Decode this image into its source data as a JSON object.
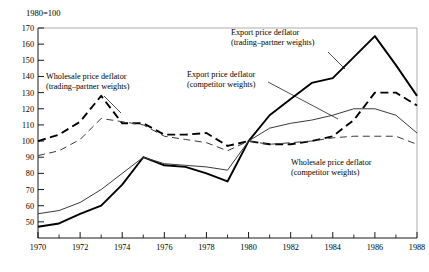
{
  "chart_data": {
    "type": "line",
    "title": "",
    "unit_note": "1980=100",
    "xlabel": "",
    "ylabel": "",
    "x": [
      1970,
      1971,
      1972,
      1973,
      1974,
      1975,
      1976,
      1977,
      1978,
      1979,
      1980,
      1981,
      1982,
      1983,
      1984,
      1985,
      1986,
      1987,
      1988
    ],
    "xlim": [
      1970,
      1988
    ],
    "ylim": [
      40,
      170
    ],
    "ytick_labels": [
      "50",
      "60",
      "70",
      "80",
      "90",
      "100",
      "110",
      "120",
      "130",
      "140",
      "150",
      "160",
      "170"
    ],
    "yticks": [
      50,
      60,
      70,
      80,
      90,
      100,
      110,
      120,
      130,
      140,
      150,
      160,
      170
    ],
    "xtick_labels": [
      "1970",
      "1972",
      "1974",
      "1976",
      "1978",
      "1980",
      "1982",
      "1984",
      "1986",
      "1988"
    ],
    "xticks_major": [
      1970,
      1972,
      1974,
      1976,
      1978,
      1980,
      1982,
      1984,
      1986,
      1988
    ],
    "xticks_minor": [
      1971,
      1973,
      1975,
      1977,
      1979,
      1981,
      1983,
      1985,
      1987
    ],
    "grid": false,
    "legend_position": "inline-annotations",
    "series": [
      {
        "name": "Wholesale price deflator (trading-partner weights)",
        "style": "dashed",
        "width": "thick",
        "color": "#000000",
        "values": [
          100,
          104,
          112,
          128,
          111,
          111,
          104,
          104,
          105,
          97,
          100,
          98,
          98,
          100,
          103,
          113,
          130,
          130,
          122
        ]
      },
      {
        "name": "Wholesale price deflator (competitor weights)",
        "style": "dashed",
        "width": "thin",
        "color": "#3a3a3a",
        "values": [
          91,
          94,
          101,
          114,
          112,
          110,
          103,
          101,
          99,
          94,
          100,
          98,
          99,
          100,
          102,
          103,
          103,
          103,
          98
        ]
      },
      {
        "name": "Export price deflator (trading-partner weights)",
        "style": "solid",
        "width": "thick",
        "color": "#000000",
        "values": [
          47,
          49,
          55,
          60,
          73,
          90,
          85,
          84,
          80,
          75,
          100,
          116,
          126,
          136,
          139,
          152,
          165,
          147,
          128
        ]
      },
      {
        "name": "Export price deflator (competitor weights)",
        "style": "solid",
        "width": "thin",
        "color": "#3a3a3a",
        "values": [
          55,
          57,
          62,
          70,
          80,
          90,
          86,
          85,
          84,
          82,
          100,
          108,
          111,
          113,
          116,
          120,
          120,
          116,
          105
        ]
      }
    ],
    "annotations": [
      {
        "id": "wpd-tp",
        "line1": "Wholesale price deflator",
        "line2": "(trading–partner weights)",
        "leader_from": [
          104,
          96
        ],
        "leader_to": [
          121,
          113
        ]
      },
      {
        "id": "epd-tp",
        "line1": "Export price deflator",
        "line2": "(trading–partner weights)",
        "leader_from": [
          328,
          52
        ],
        "leader_to": [
          345,
          69
        ]
      },
      {
        "id": "epd-cw",
        "line1": "Export price deflator",
        "line2": "(competitor weights)",
        "leader_from": [
          268,
          82
        ],
        "leader_to": [
          338,
          119
        ]
      },
      {
        "id": "wpd-cw",
        "line1": "Wholesale price deflator",
        "line2": "(competitor weights)",
        "leader_from": null,
        "leader_to": null
      }
    ]
  }
}
